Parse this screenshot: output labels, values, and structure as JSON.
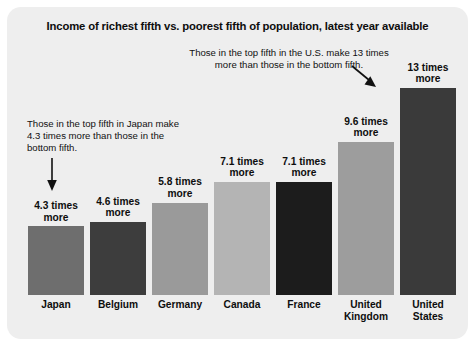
{
  "chart_data": {
    "type": "bar",
    "title": "Income of richest fifth vs. poorest fifth of population, latest year available",
    "xlabel": "",
    "ylabel": "",
    "ylim": [
      0,
      14
    ],
    "grid": false,
    "legend": null,
    "categories": [
      "Japan",
      "Belgium",
      "Germany",
      "Canada",
      "France",
      "United Kingdom",
      "United States"
    ],
    "values": [
      4.3,
      4.6,
      5.8,
      7.1,
      7.1,
      9.6,
      13
    ],
    "value_labels": [
      "4.3 times more",
      "4.6 times more",
      "5.8 times more",
      "7.1 times more",
      "7.1 times more",
      "9.6 times more",
      "13 times more"
    ],
    "bar_colors": [
      "#6e6e6e",
      "#3d3d3d",
      "#9a9a9a",
      "#b4b4b4",
      "#1c1c1c",
      "#9d9d9d",
      "#3a3a3a"
    ],
    "annotations": [
      {
        "name": "japan",
        "text": "Those in the top fifth in Japan make 4.3 times more than those in the bottom fifth.",
        "points_to": "Japan"
      },
      {
        "name": "united-states",
        "text": "Those in the top fifth in the U.S. make 13 times more than those in the bottom fifth.",
        "points_to": "United States"
      }
    ]
  },
  "panel": {
    "background_color": "#eeeeee"
  },
  "bars": [
    {
      "label": "Japan",
      "value_label": "4.3 times more",
      "value": 4.3,
      "color": "#6e6e6e"
    },
    {
      "label": "Belgium",
      "value_label": "4.6 times more",
      "value": 4.6,
      "color": "#3d3d3d"
    },
    {
      "label": "Germany",
      "value_label": "5.8 times more",
      "value": 5.8,
      "color": "#9a9a9a"
    },
    {
      "label": "Canada",
      "value_label": "7.1 times more",
      "value": 7.1,
      "color": "#b4b4b4"
    },
    {
      "label": "France",
      "value_label": "7.1 times more",
      "value": 7.1,
      "color": "#1c1c1c"
    },
    {
      "label": "United Kingdom",
      "value_label": "9.6 times more",
      "value": 9.6,
      "color": "#9d9d9d"
    },
    {
      "label": "United States",
      "value_label": "13 times more",
      "value": 13,
      "color": "#3a3a3a"
    }
  ],
  "annotations": {
    "japan": "Those in the top fifth in Japan make 4.3 times more than those in the bottom fifth.",
    "united_states": "Those in the top fifth in the U.S. make 13 times more than those in the bottom fifth."
  }
}
